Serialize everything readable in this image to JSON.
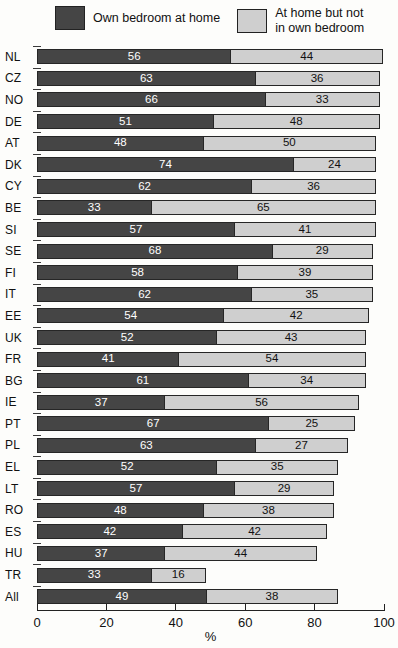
{
  "legend": {
    "series1_label": "Own bedroom at home",
    "series2_label_line1": "At home but not",
    "series2_label_line2": "in own bedroom"
  },
  "colors": {
    "dark_series": "#454545",
    "light_series": "#cfcfcf",
    "border": "#262626",
    "background": "#fdfdfb"
  },
  "axis": {
    "tick_labels": [
      "0",
      "20",
      "40",
      "60",
      "80",
      "100"
    ],
    "tick_values": [
      0,
      20,
      40,
      60,
      80,
      100
    ],
    "xlabel": "%"
  },
  "chart_data": {
    "type": "bar",
    "stacked": true,
    "orientation": "horizontal",
    "title": "",
    "xlabel": "%",
    "xlim": [
      0,
      100
    ],
    "grid": false,
    "legend_position": "top",
    "categories": [
      "NL",
      "CZ",
      "NO",
      "DE",
      "AT",
      "DK",
      "CY",
      "BE",
      "SI",
      "SE",
      "FI",
      "IT",
      "EE",
      "UK",
      "FR",
      "BG",
      "IE",
      "PT",
      "PL",
      "EL",
      "LT",
      "RO",
      "ES",
      "HU",
      "TR",
      "All"
    ],
    "series": [
      {
        "name": "Own bedroom at home",
        "color": "#454545",
        "text_color": "#ffffff",
        "values": [
          56,
          63,
          66,
          51,
          48,
          74,
          62,
          33,
          57,
          68,
          58,
          62,
          54,
          52,
          41,
          61,
          37,
          67,
          63,
          52,
          57,
          48,
          42,
          37,
          33,
          49
        ]
      },
      {
        "name": "At home but not in own bedroom",
        "color": "#cfcfcf",
        "text_color": "#111111",
        "values": [
          44,
          36,
          33,
          48,
          50,
          24,
          36,
          65,
          41,
          29,
          39,
          35,
          42,
          43,
          54,
          34,
          56,
          25,
          27,
          35,
          29,
          38,
          42,
          44,
          16,
          38
        ]
      }
    ]
  }
}
